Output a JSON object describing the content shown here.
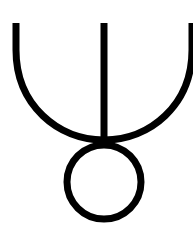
{
  "symbol": {
    "name": "fork-over-circle-symbol",
    "stroke_color": "#000000",
    "background_color": "#ffffff",
    "stroke_width": 7,
    "arc": {
      "left_x": 16,
      "right_x": 192,
      "top_y": 23,
      "bottom_y": 140
    },
    "stem": {
      "x": 104,
      "top_y": 23,
      "bottom_y": 143
    },
    "circle": {
      "cx": 104,
      "cy": 182,
      "r": 37
    }
  }
}
